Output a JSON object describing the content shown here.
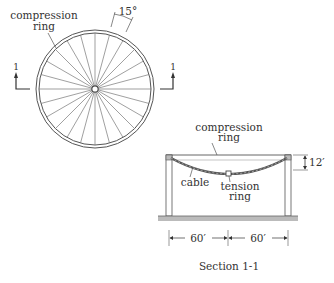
{
  "plan_view": {
    "compression_ring_label_line1": "compression",
    "compression_ring_label_line2": "ring",
    "angle_label": "15°",
    "section_marker_left": "1",
    "section_marker_right": "1",
    "spoke_count": 24
  },
  "section_view": {
    "compression_ring_label_line1": "compression",
    "compression_ring_label_line2": "ring",
    "cable_label": "cable",
    "tension_ring_label_line1": "tension",
    "tension_ring_label_line2": "ring",
    "height_dim": "12′",
    "span_left_dim": "60′",
    "span_right_dim": "60′",
    "caption": "Section 1-1"
  },
  "colors": {
    "line": "#555555",
    "text": "#333333",
    "ground": "#999999"
  }
}
